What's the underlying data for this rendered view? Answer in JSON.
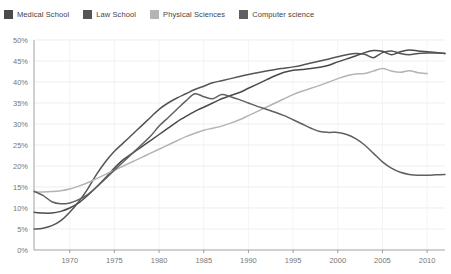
{
  "legend": {
    "position": "top-left",
    "items": [
      {
        "label": "Medical School",
        "color": "#4a4a4a",
        "swatch": "legend-swatch"
      },
      {
        "label": "Law School",
        "color": "#555555",
        "swatch": "legend-swatch"
      },
      {
        "label": "Physical Sciences",
        "color": "#b4b4b4",
        "swatch": "legend-swatch"
      },
      {
        "label": "Computer science",
        "color": "#606060",
        "swatch": "legend-swatch"
      }
    ]
  },
  "chart_data": {
    "type": "line",
    "title": "",
    "subtitle": "",
    "xlabel": "",
    "ylabel": "",
    "xlim": [
      1966,
      2012
    ],
    "ylim": [
      0,
      50
    ],
    "grid": true,
    "legend_position": "top-left",
    "x_ticks": [
      1970,
      1975,
      1980,
      1985,
      1990,
      1995,
      2000,
      2005,
      2010
    ],
    "x_tick_labels": [
      "1970",
      "1975",
      "1980",
      "1985",
      "1990",
      "1995",
      "2000",
      "2005",
      "2010"
    ],
    "y_ticks": [
      0,
      5,
      10,
      15,
      20,
      25,
      30,
      35,
      40,
      45,
      50
    ],
    "y_tick_labels": [
      "0%",
      "5%",
      "10%",
      "15%",
      "20%",
      "25%",
      "30%",
      "35%",
      "40%",
      "45%",
      "50%"
    ],
    "series": [
      {
        "name": "Medical School",
        "color": "#4a4a4a",
        "x": [
          1966,
          1967,
          1968,
          1969,
          1970,
          1971,
          1972,
          1973,
          1974,
          1975,
          1976,
          1977,
          1978,
          1979,
          1980,
          1981,
          1982,
          1983,
          1984,
          1985,
          1986,
          1987,
          1988,
          1989,
          1990,
          1991,
          1992,
          1993,
          1994,
          1995,
          1996,
          1997,
          1998,
          1999,
          2000,
          2001,
          2002,
          2003,
          2004,
          2005,
          2006,
          2007,
          2008,
          2009,
          2010,
          2011,
          2012
        ],
        "values": [
          9.0,
          8.8,
          8.8,
          9.2,
          10.0,
          11.2,
          13.0,
          15.0,
          17.2,
          19.5,
          21.5,
          23.0,
          24.5,
          26.0,
          27.5,
          29.0,
          30.5,
          31.8,
          33.0,
          34.0,
          35.0,
          36.0,
          36.8,
          37.5,
          38.5,
          39.5,
          40.5,
          41.5,
          42.3,
          42.8,
          43.0,
          43.2,
          43.5,
          44.0,
          44.8,
          45.5,
          46.2,
          47.0,
          47.5,
          47.3,
          46.5,
          47.2,
          47.6,
          47.4,
          47.2,
          47.0,
          46.8
        ]
      },
      {
        "name": "Law School",
        "color": "#555555",
        "x": [
          1966,
          1967,
          1968,
          1969,
          1970,
          1971,
          1972,
          1973,
          1974,
          1975,
          1976,
          1977,
          1978,
          1979,
          1980,
          1981,
          1982,
          1983,
          1984,
          1985,
          1986,
          1987,
          1988,
          1989,
          1990,
          1991,
          1992,
          1993,
          1994,
          1995,
          1996,
          1997,
          1998,
          1999,
          2000,
          2001,
          2002,
          2003,
          2004,
          2005,
          2006,
          2007,
          2008,
          2009,
          2010,
          2011,
          2012
        ],
        "values": [
          5.0,
          5.2,
          5.8,
          7.0,
          9.0,
          11.5,
          14.5,
          18.0,
          21.0,
          23.5,
          25.5,
          27.5,
          29.5,
          31.5,
          33.5,
          35.0,
          36.2,
          37.2,
          38.2,
          39.0,
          39.8,
          40.3,
          40.8,
          41.3,
          41.8,
          42.2,
          42.6,
          43.0,
          43.3,
          43.6,
          44.0,
          44.5,
          45.0,
          45.5,
          46.0,
          46.5,
          46.8,
          46.6,
          45.8,
          47.0,
          47.4,
          46.8,
          46.5,
          46.8,
          46.9,
          46.9,
          46.8
        ]
      },
      {
        "name": "Physical Sciences",
        "color": "#b4b4b4",
        "x": [
          1966,
          1967,
          1968,
          1969,
          1970,
          1971,
          1972,
          1973,
          1974,
          1975,
          1976,
          1977,
          1978,
          1979,
          1980,
          1981,
          1982,
          1983,
          1984,
          1985,
          1986,
          1987,
          1988,
          1989,
          1990,
          1991,
          1992,
          1993,
          1994,
          1995,
          1996,
          1997,
          1998,
          1999,
          2000,
          2001,
          2002,
          2003,
          2004,
          2005,
          2006,
          2007,
          2008,
          2009,
          2010
        ],
        "values": [
          13.8,
          13.8,
          13.9,
          14.1,
          14.5,
          15.2,
          16.0,
          17.0,
          18.0,
          19.0,
          20.0,
          21.0,
          22.0,
          23.0,
          24.0,
          25.0,
          26.0,
          27.0,
          27.8,
          28.5,
          29.0,
          29.5,
          30.2,
          31.0,
          32.0,
          33.0,
          34.0,
          35.0,
          36.0,
          37.0,
          37.8,
          38.5,
          39.2,
          40.0,
          40.8,
          41.5,
          41.9,
          42.0,
          42.6,
          43.2,
          42.6,
          42.3,
          42.7,
          42.2,
          42.0
        ]
      },
      {
        "name": "Computer science",
        "color": "#606060",
        "x": [
          1966,
          1967,
          1968,
          1969,
          1970,
          1971,
          1972,
          1973,
          1974,
          1975,
          1976,
          1977,
          1978,
          1979,
          1980,
          1981,
          1982,
          1983,
          1984,
          1985,
          1986,
          1987,
          1988,
          1989,
          1990,
          1991,
          1992,
          1993,
          1994,
          1995,
          1996,
          1997,
          1998,
          1999,
          2000,
          2001,
          2002,
          2003,
          2004,
          2005,
          2006,
          2007,
          2008,
          2009,
          2010,
          2011,
          2012
        ],
        "values": [
          14.0,
          13.0,
          11.5,
          11.0,
          11.2,
          12.0,
          13.2,
          15.0,
          17.0,
          19.0,
          21.0,
          23.0,
          25.0,
          27.0,
          29.5,
          31.5,
          33.5,
          35.5,
          37.2,
          36.5,
          36.0,
          37.0,
          36.5,
          35.8,
          35.0,
          34.2,
          33.5,
          32.8,
          32.0,
          31.0,
          30.0,
          29.0,
          28.2,
          28.0,
          28.0,
          27.5,
          26.5,
          25.0,
          23.0,
          21.0,
          19.5,
          18.5,
          18.0,
          17.8,
          17.8,
          17.9,
          18.0
        ]
      }
    ]
  },
  "axes": {
    "axis_color": "#8a8a8a",
    "grid_color": "#e3e3e3"
  }
}
